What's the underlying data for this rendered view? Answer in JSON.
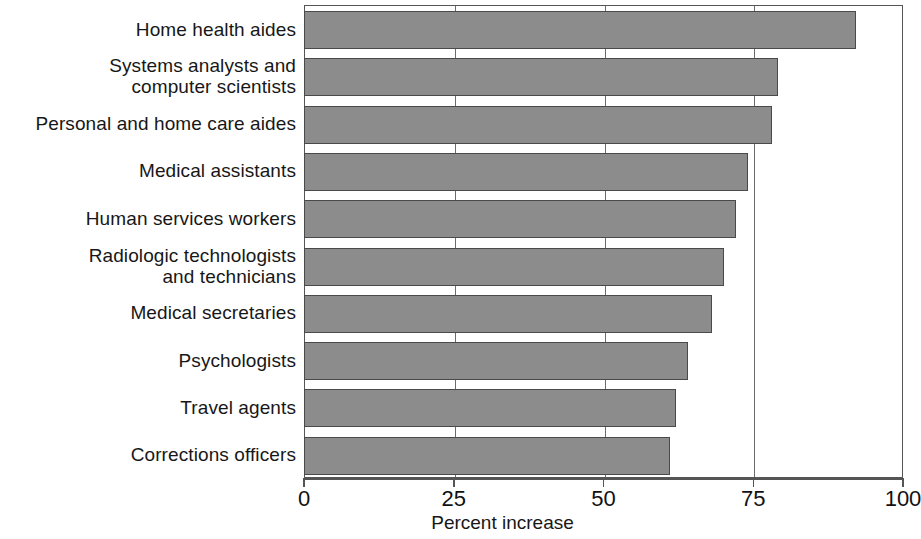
{
  "chart_data": {
    "type": "bar",
    "orientation": "horizontal",
    "title": "",
    "subtitle": "",
    "xlabel": "Percent increase",
    "ylabel": "",
    "xlim": [
      0,
      100
    ],
    "xticks": [
      0,
      25,
      50,
      75,
      100
    ],
    "xtick_labels": [
      "0",
      "25",
      "50",
      "75",
      "100"
    ],
    "grid": true,
    "gridlines_at": [
      25,
      50,
      75
    ],
    "legend": null,
    "bar_color": "#8c8c8c",
    "bar_border_color": "#4a4a4a",
    "axis_color": "#555555",
    "categories": [
      "Home health aides",
      "Systems analysts and\ncomputer scientists",
      "Personal and home care aides",
      "Medical assistants",
      "Human services workers",
      "Radiologic technologists\nand technicians",
      "Medical secretaries",
      "Psychologists",
      "Travel agents",
      "Corrections  officers"
    ],
    "values": [
      92,
      79,
      78,
      74,
      72,
      70,
      68,
      64,
      62,
      61
    ]
  }
}
